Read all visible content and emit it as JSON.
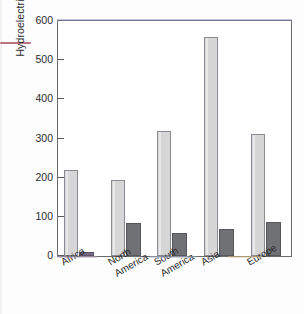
{
  "figure": {
    "background_color": "#fdfdfd",
    "plot_border_color": "#6b6b6b"
  },
  "axis": {
    "ylabel": "Hydroelectric power (GW)",
    "yticks": [
      "0",
      "100",
      "200",
      "300",
      "400",
      "500",
      "600"
    ]
  },
  "colors": {
    "series_light": "#d6d6d6",
    "series_dark": "#6f7175",
    "africa_small_bar": "#7a6a86",
    "text": "#2b2b2b"
  },
  "chart_data": {
    "type": "bar",
    "title": "",
    "xlabel": "",
    "ylabel": "Hydroelectric power (GW)",
    "ylim": [
      0,
      600
    ],
    "yticks": [
      0,
      100,
      200,
      300,
      400,
      500,
      600
    ],
    "grid": false,
    "legend": "none",
    "categories": [
      "Africa",
      "North\nAmerica",
      "South\nAmerica",
      "Asia",
      "Europe"
    ],
    "series": [
      {
        "name": "Technically feasible potential",
        "color": "#d6d6d6",
        "values": [
          220,
          195,
          320,
          558,
          311
        ]
      },
      {
        "name": "Installed capacity",
        "color": "#6f7175",
        "values": [
          11,
          85,
          60,
          68,
          86
        ]
      }
    ]
  }
}
